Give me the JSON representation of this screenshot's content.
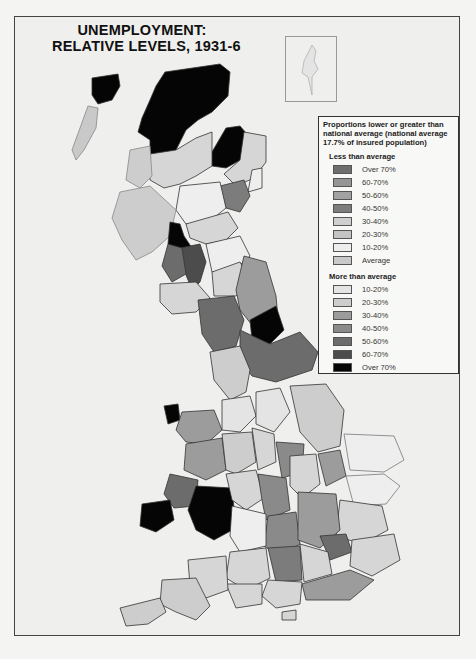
{
  "title": {
    "line1": "UNEMPLOYMENT:",
    "line2": "RELATIVE LEVELS, 1931-6"
  },
  "legend": {
    "heading": "Proportions lower or greater than national average (national average 17.7% of insured population)",
    "less_than": {
      "label": "Less than average",
      "items": [
        {
          "label": "Over 70%",
          "color": "#6e6e6e"
        },
        {
          "label": "60-70%",
          "color": "#959595"
        },
        {
          "label": "50-60%",
          "color": "#a2a2a2"
        },
        {
          "label": "40-50%",
          "color": "#7c7c7c"
        },
        {
          "label": "30-40%",
          "color": "#cfcfcf"
        },
        {
          "label": "20-30%",
          "color": "#c4c4c4"
        },
        {
          "label": "10-20%",
          "color": "#eeeeee"
        },
        {
          "label": "Average",
          "color": "#c9c9c9"
        }
      ]
    },
    "more_than": {
      "label": "More than average",
      "items": [
        {
          "label": "10-20%",
          "color": "#e4e4e4"
        },
        {
          "label": "20-30%",
          "color": "#cdcdcd"
        },
        {
          "label": "30-40%",
          "color": "#9c9c9c"
        },
        {
          "label": "40-50%",
          "color": "#8a8a8a"
        },
        {
          "label": "50-60%",
          "color": "#6c6c6c"
        },
        {
          "label": "60-70%",
          "color": "#4c4c4c"
        },
        {
          "label": "Over 70%",
          "color": "#050505"
        }
      ]
    }
  },
  "chart_data": {
    "type": "choropleth",
    "title": "UNEMPLOYMENT: RELATIVE LEVELS, 1931-6",
    "national_average_pct": 17.7,
    "classes_less_than_average": [
      "Over 70%",
      "60-70%",
      "50-60%",
      "40-50%",
      "30-40%",
      "20-30%",
      "10-20%",
      "Average"
    ],
    "classes_more_than_average": [
      "10-20%",
      "20-30%",
      "30-40%",
      "40-50%",
      "50-60%",
      "60-70%",
      "Over 70%"
    ],
    "notable_regions": [
      {
        "region": "North-west Highlands & Islands (Lewis)",
        "class": "More than average, Over 70%"
      },
      {
        "region": "Central Scotland / Clyde",
        "class": "More than average, Over 70%"
      },
      {
        "region": "Durham",
        "class": "More than average, Over 70%"
      },
      {
        "region": "Anglesey",
        "class": "More than average, Over 70%"
      },
      {
        "region": "Glamorgan / Monmouth (South Wales)",
        "class": "More than average, Over 70%"
      },
      {
        "region": "Lancashire & Yorkshire",
        "class": "More than average, 50-60%"
      },
      {
        "region": "South-east England",
        "class": "Less than average"
      }
    ],
    "inset": "Shetland Islands"
  }
}
